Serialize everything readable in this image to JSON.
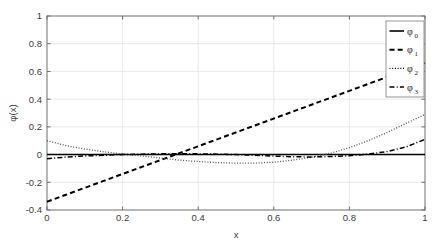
{
  "chart_data": {
    "type": "line",
    "title": "",
    "xlabel": "x",
    "ylabel": "φ(x)",
    "xlim": [
      0,
      1
    ],
    "ylim": [
      -0.4,
      1
    ],
    "grid": true,
    "legend_position": "top-right",
    "xticks": [
      "0",
      "0.2",
      "0.4",
      "0.6",
      "0.8",
      "1"
    ],
    "xtick_values": [
      0,
      0.2,
      0.4,
      0.6,
      0.8,
      1
    ],
    "yticks": [
      "-0.4",
      "-0.2",
      "0",
      "0.2",
      "0.4",
      "0.6",
      "0.8",
      "1"
    ],
    "ytick_values": [
      -0.4,
      -0.2,
      0,
      0.2,
      0.4,
      0.6,
      0.8,
      1
    ],
    "x": [
      0,
      0.05,
      0.1,
      0.15,
      0.2,
      0.25,
      0.3,
      0.35,
      0.4,
      0.45,
      0.5,
      0.55,
      0.6,
      0.65,
      0.7,
      0.75,
      0.8,
      0.85,
      0.9,
      0.95,
      1
    ],
    "series": [
      {
        "name": "φ",
        "subscript": "0",
        "label": "φ₀",
        "style": "solid",
        "color": "#000000",
        "values": [
          0,
          0,
          0,
          0,
          0,
          0,
          0,
          0,
          0,
          0,
          0,
          0,
          0,
          0,
          0,
          0,
          0,
          0,
          0,
          0,
          0
        ]
      },
      {
        "name": "φ",
        "subscript": "1",
        "label": "φ₁",
        "style": "dashed",
        "color": "#000000",
        "values": [
          -0.34,
          -0.29,
          -0.24,
          -0.19,
          -0.14,
          -0.09,
          -0.04,
          0.01,
          0.06,
          0.11,
          0.16,
          0.21,
          0.26,
          0.31,
          0.36,
          0.41,
          0.46,
          0.51,
          0.56,
          0.61,
          0.66
        ]
      },
      {
        "name": "φ",
        "subscript": "2",
        "label": "φ₂",
        "style": "dotted",
        "color": "#555555",
        "values": [
          0.1,
          0.065,
          0.04,
          0.02,
          0.005,
          -0.01,
          -0.025,
          -0.04,
          -0.05,
          -0.058,
          -0.062,
          -0.062,
          -0.055,
          -0.04,
          -0.02,
          0.01,
          0.05,
          0.1,
          0.16,
          0.225,
          0.29
        ]
      },
      {
        "name": "φ",
        "subscript": "3",
        "label": "φ₃",
        "style": "dashdot",
        "color": "#000000",
        "values": [
          -0.03,
          -0.018,
          -0.01,
          -0.005,
          0.0,
          0.003,
          0.005,
          0.006,
          0.005,
          0.003,
          0.0,
          -0.005,
          -0.011,
          -0.016,
          -0.017,
          -0.014,
          -0.008,
          0.003,
          0.022,
          0.055,
          0.11
        ]
      }
    ]
  },
  "axes": {
    "xlabel": "x",
    "ylabel": "φ(x)"
  },
  "legend": {
    "entries": [
      {
        "base": "φ",
        "sub": "0",
        "style": "solid"
      },
      {
        "base": "φ",
        "sub": "1",
        "style": "dashed"
      },
      {
        "base": "φ",
        "sub": "2",
        "style": "dotted"
      },
      {
        "base": "φ",
        "sub": "3",
        "style": "dashdot"
      }
    ]
  },
  "colors": {
    "axis": "#6e6e6e",
    "grid": "#e2e2e2",
    "text": "#3b3b3b",
    "line": "#000000",
    "background": "#ffffff"
  }
}
